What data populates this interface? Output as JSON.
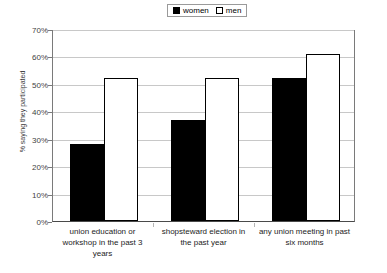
{
  "chart_data": {
    "type": "bar",
    "title": "",
    "subtitle": "",
    "xlabel": "",
    "ylabel": "% saying they participated",
    "ylim": [
      0,
      70
    ],
    "ytick_labels": [
      "70%",
      "60%",
      "50%",
      "40%",
      "30%",
      "20%",
      "10%",
      "0%"
    ],
    "ytick_values": [
      70,
      60,
      50,
      40,
      30,
      20,
      10,
      0
    ],
    "grid": true,
    "legend_position": "top-center",
    "categories": [
      "union education or workshop in the past 3 years",
      "shopsteward election in the past year",
      "any union meeting in past six months"
    ],
    "category_lines": [
      [
        "union education or",
        "workshop in the past 3",
        "years"
      ],
      [
        "shopsteward election in",
        "the past year"
      ],
      [
        "any union meeting in past",
        "six months"
      ]
    ],
    "series": [
      {
        "name": "women",
        "color": "#000000",
        "style": "filled",
        "values": [
          28,
          37,
          52
        ]
      },
      {
        "name": "men",
        "color": "#ffffff",
        "style": "hollow",
        "values": [
          52,
          52,
          61
        ]
      }
    ]
  },
  "legend": {
    "entries": [
      {
        "label": "women",
        "swatch": "filled-square-icon"
      },
      {
        "label": "men",
        "swatch": "hollow-square-icon"
      }
    ]
  },
  "colors": {
    "women_fill": "#000000",
    "men_fill": "#ffffff",
    "bar_outline": "#000000",
    "gridline": "#c8c8c8",
    "axis": "#7a7a7a",
    "background": "#ffffff",
    "tick_text": "#3f3f3f"
  }
}
